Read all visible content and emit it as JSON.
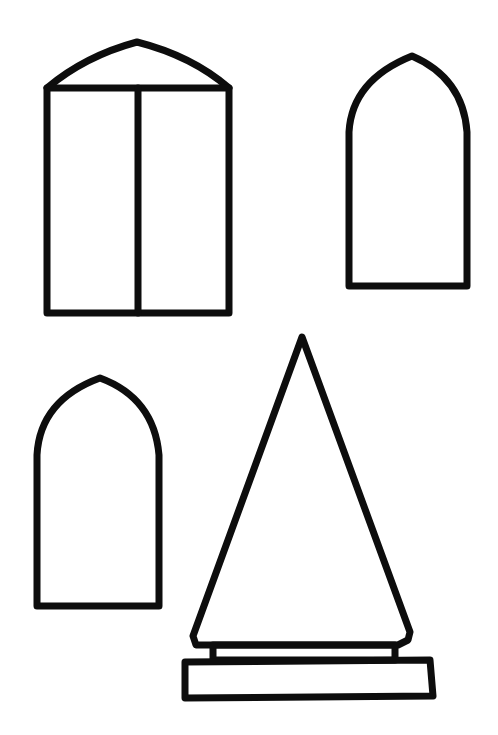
{
  "canvas": {
    "width": 498,
    "height": 735,
    "background": "#ffffff",
    "stroke_color": "#0d0d0d"
  },
  "shapes": [
    {
      "name": "double-window-with-pointed-top",
      "description": "Rectangular window split into two panes by a vertical mullion, topped with a shallow pointed arch"
    },
    {
      "name": "gothic-arch-window-right",
      "description": "Tall window with a pointed (gothic) arch top"
    },
    {
      "name": "gothic-arch-window-left",
      "description": "Tall window with a pointed (gothic) arch top"
    },
    {
      "name": "cone-spire-on-plinth",
      "description": "Tall triangular spire sitting on a two-tier rectangular base"
    }
  ]
}
